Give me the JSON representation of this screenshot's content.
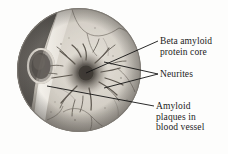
{
  "figure": {
    "background_color": "#fdfdfc",
    "ink_color": "#1b1b1b"
  },
  "micrograph": {
    "name": "circular-micrograph",
    "shape": "circle",
    "diameter_px": 124,
    "center_x_px": 79,
    "center_y_px": 70,
    "palette": {
      "tissue_light": "#ded9d1",
      "tissue_mid": "#c4bfb6",
      "tissue_dark": "#8e8880",
      "vessel_lumen_dark": "#5d5a56",
      "vessel_wall_light": "#efece6",
      "plaque_core": "#4a4641",
      "neurite_stroke": "#6b655e",
      "rim": "#8d8a84"
    },
    "features": [
      {
        "name": "blood-vessel-wedge",
        "description": "dark wedge of vessel at left of field"
      },
      {
        "name": "vessel-wall-band",
        "description": "pale curving band forming the vessel wall"
      },
      {
        "name": "vessel-lumen-ring",
        "description": "small oval ring, cross-sectioned vessel lumen"
      },
      {
        "name": "plaque-core",
        "description": "dark diffuse round core at field centre"
      },
      {
        "name": "neurite-threads",
        "description": "short dark dystrophic neurite threads radiating from the core"
      },
      {
        "name": "capillary-branches",
        "description": "thin branching capillaries across the tissue"
      }
    ]
  },
  "labels": [
    {
      "key": "core",
      "name": "label-beta-amyloid-protein-core",
      "text": "Beta amyloid\nprotein core",
      "leader": {
        "from_x": 158,
        "from_y": 41,
        "to_x": 86,
        "to_y": 73
      }
    },
    {
      "key": "neurites",
      "name": "label-neurites",
      "text": "Neurites",
      "leaders": [
        {
          "from_x": 158,
          "from_y": 74,
          "to_x": 104,
          "to_y": 62
        },
        {
          "from_x": 158,
          "from_y": 74,
          "to_x": 104,
          "to_y": 88
        }
      ]
    },
    {
      "key": "plaques",
      "name": "label-amyloid-plaques-in-blood-vessel",
      "text": "Amyloid\nplaques in\nblood vessel",
      "leader": {
        "from_x": 154,
        "from_y": 106,
        "to_x": 47,
        "to_y": 86
      }
    }
  ]
}
